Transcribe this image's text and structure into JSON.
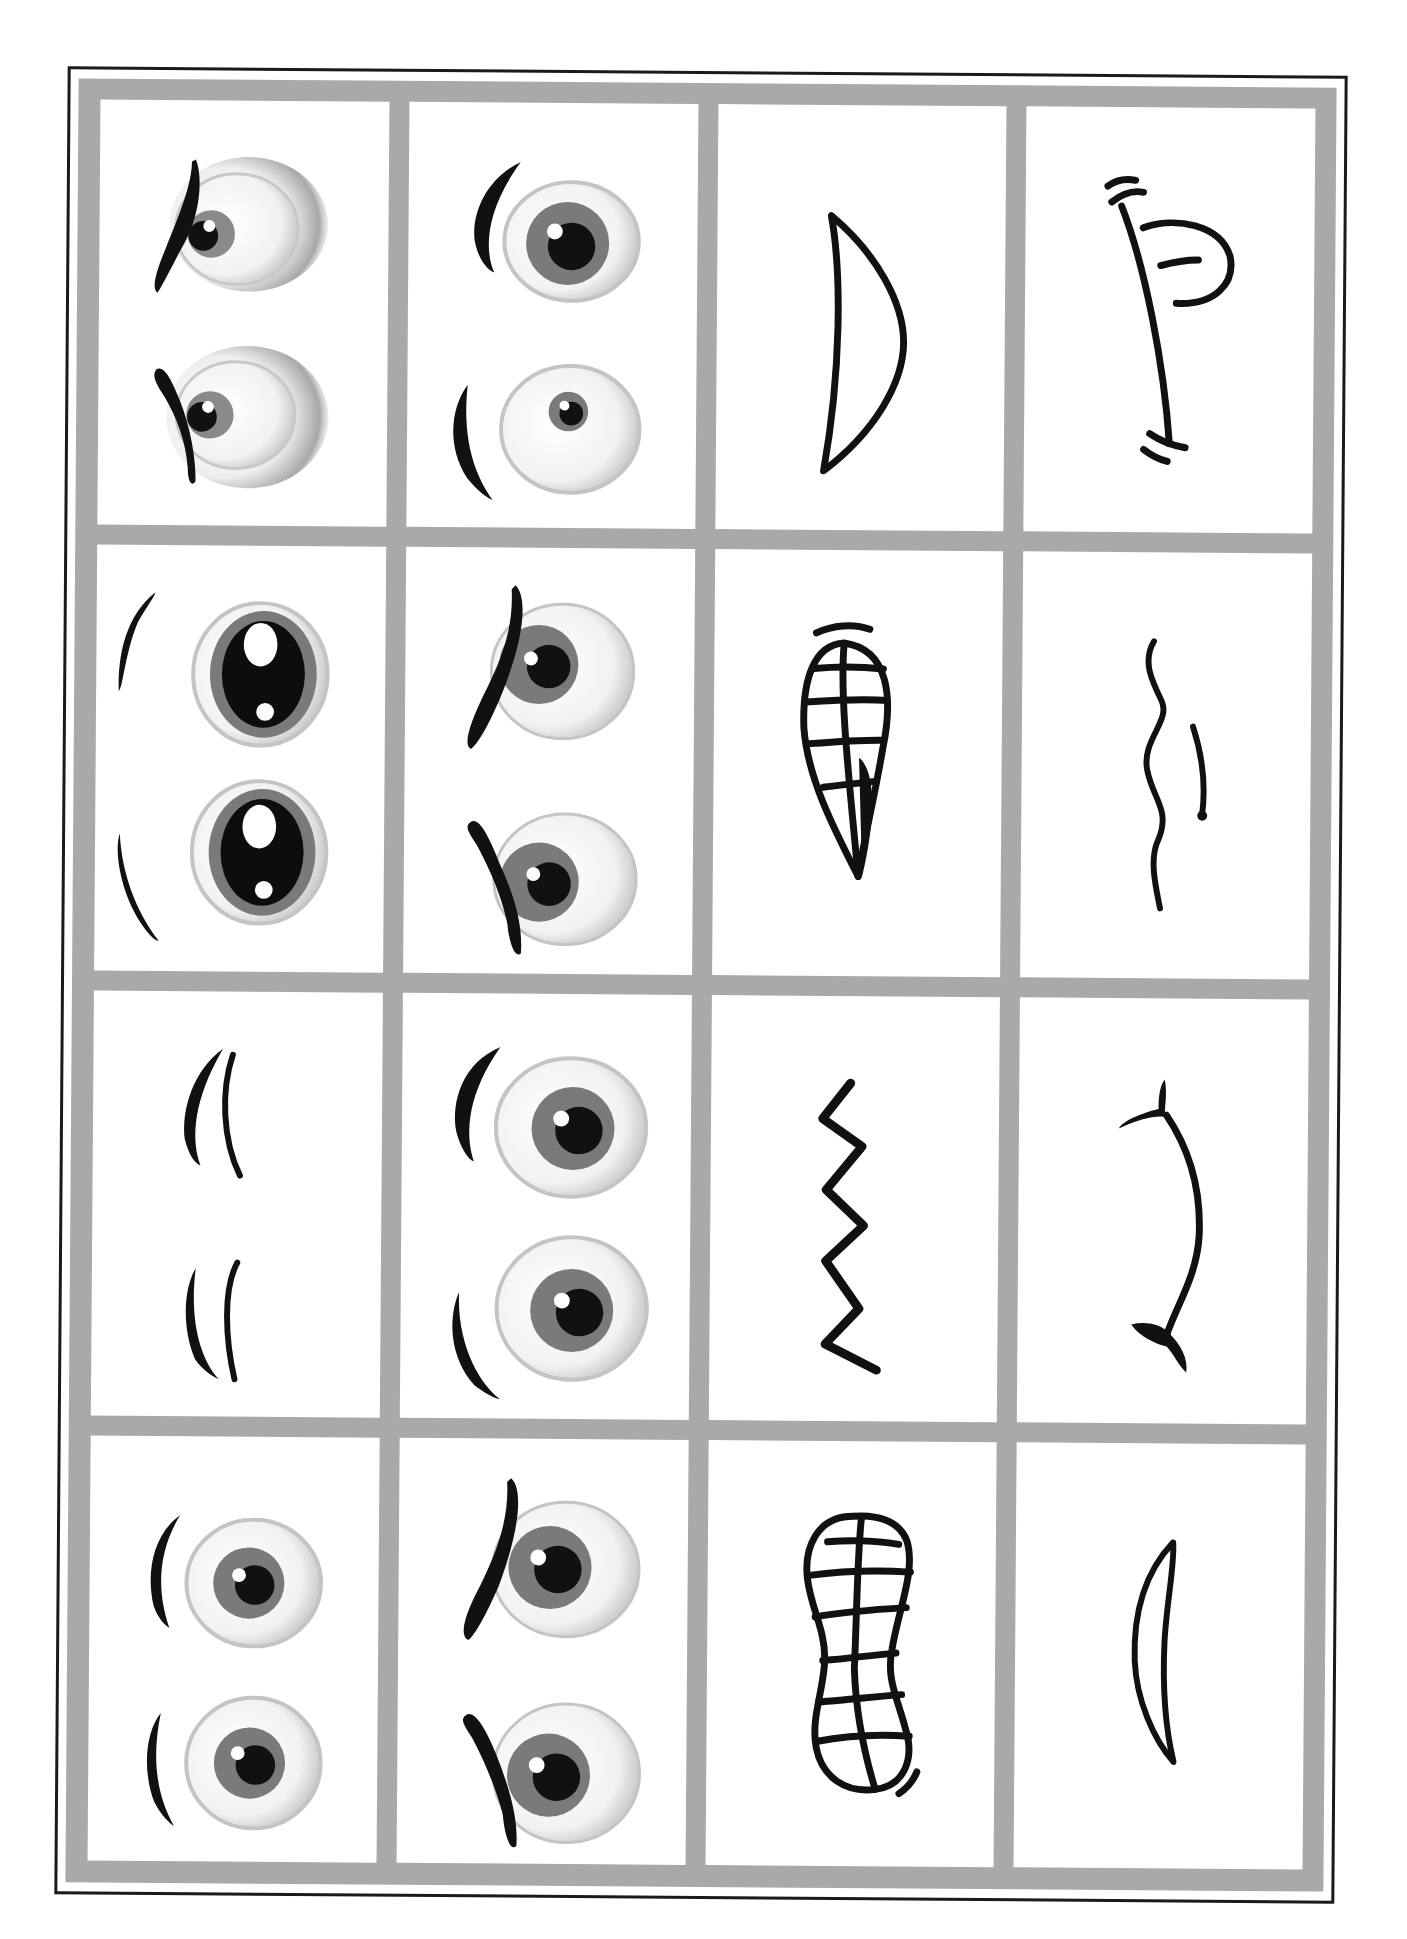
{
  "sheet": {
    "title": "",
    "layout": {
      "rows": 4,
      "columns": 4
    },
    "colors": {
      "frame_gray": "#a9a9a9",
      "border_black": "#1a1a1a",
      "cell_bg": "#ffffff",
      "ink": "#111111",
      "iris_gray": "#7a7a7a"
    },
    "cells": [
      {
        "row": 1,
        "col": 1,
        "type": "eyes",
        "icon": "angry-side-glance-eyes-icon"
      },
      {
        "row": 1,
        "col": 2,
        "type": "eyes",
        "icon": "surprised-eyes-icon"
      },
      {
        "row": 1,
        "col": 3,
        "type": "mouth",
        "icon": "open-smile-mouth-icon"
      },
      {
        "row": 1,
        "col": 4,
        "type": "mouth",
        "icon": "tongue-out-mouth-icon"
      },
      {
        "row": 2,
        "col": 1,
        "type": "eyes",
        "icon": "big-sparkle-eyes-icon"
      },
      {
        "row": 2,
        "col": 2,
        "type": "eyes",
        "icon": "frowning-eyes-icon"
      },
      {
        "row": 2,
        "col": 3,
        "type": "mouth",
        "icon": "teeth-grin-mouth-icon"
      },
      {
        "row": 2,
        "col": 4,
        "type": "mouth",
        "icon": "wavy-nervous-mouth-icon"
      },
      {
        "row": 3,
        "col": 1,
        "type": "eyes",
        "icon": "closed-sleepy-eyes-icon"
      },
      {
        "row": 3,
        "col": 2,
        "type": "eyes",
        "icon": "wide-open-eyes-icon"
      },
      {
        "row": 3,
        "col": 3,
        "type": "mouth",
        "icon": "zigzag-mouth-icon"
      },
      {
        "row": 3,
        "col": 4,
        "type": "mouth",
        "icon": "smirk-mouth-icon"
      },
      {
        "row": 4,
        "col": 1,
        "type": "eyes",
        "icon": "calm-eyes-icon"
      },
      {
        "row": 4,
        "col": 2,
        "type": "eyes",
        "icon": "angry-eyes-icon"
      },
      {
        "row": 4,
        "col": 3,
        "type": "mouth",
        "icon": "big-teeth-mouth-icon"
      },
      {
        "row": 4,
        "col": 4,
        "type": "mouth",
        "icon": "thin-smile-mouth-icon"
      }
    ]
  }
}
